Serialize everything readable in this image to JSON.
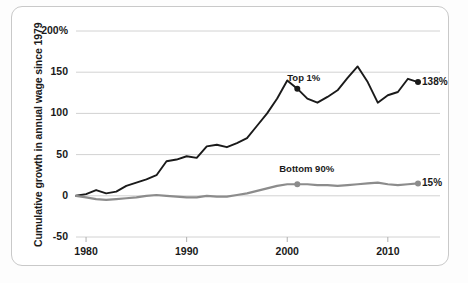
{
  "chart_data": {
    "type": "line",
    "title": "",
    "subtitle": "",
    "xlabel": "",
    "ylabel": "Cumulative growth in annual wage since 1979",
    "xlim": [
      1979,
      2013
    ],
    "ylim": [
      -50,
      200
    ],
    "grid": true,
    "legend": "inline-annotations",
    "yticks": [
      {
        "value": 200,
        "label": "200%"
      },
      {
        "value": 150,
        "label": "150"
      },
      {
        "value": 100,
        "label": "100"
      },
      {
        "value": 50,
        "label": "50"
      },
      {
        "value": 0,
        "label": "0"
      },
      {
        "value": -50,
        "label": "-50"
      }
    ],
    "xticks": [
      {
        "value": 1980,
        "label": "1980"
      },
      {
        "value": 1990,
        "label": "1990"
      },
      {
        "value": 2000,
        "label": "2000"
      },
      {
        "value": 2010,
        "label": "2010"
      }
    ],
    "series": [
      {
        "name": "Top 1%",
        "color": "#1a1a1a",
        "inline_label": "Top 1%",
        "end_label": "138%",
        "end_value": 138,
        "marker_year": 2001,
        "marker_value": 130,
        "x": [
          1979,
          1980,
          1981,
          1982,
          1983,
          1984,
          1985,
          1986,
          1987,
          1988,
          1989,
          1990,
          1991,
          1992,
          1993,
          1994,
          1995,
          1996,
          1997,
          1998,
          1999,
          2000,
          2001,
          2002,
          2003,
          2004,
          2005,
          2006,
          2007,
          2008,
          2009,
          2010,
          2011,
          2012,
          2013
        ],
        "values": [
          0,
          2,
          7,
          3,
          5,
          12,
          16,
          20,
          25,
          42,
          44,
          48,
          46,
          60,
          62,
          59,
          64,
          70,
          85,
          100,
          118,
          140,
          130,
          118,
          113,
          120,
          128,
          143,
          157,
          138,
          113,
          122,
          126,
          142,
          138
        ]
      },
      {
        "name": "Bottom 90%",
        "color": "#8c8c8c",
        "inline_label": "Bottom 90%",
        "end_label": "15%",
        "end_value": 15,
        "marker_year": 2001,
        "marker_value": 14,
        "x": [
          1979,
          1980,
          1981,
          1982,
          1983,
          1984,
          1985,
          1986,
          1987,
          1988,
          1989,
          1990,
          1991,
          1992,
          1993,
          1994,
          1995,
          1996,
          1997,
          1998,
          1999,
          2000,
          2001,
          2002,
          2003,
          2004,
          2005,
          2006,
          2007,
          2008,
          2009,
          2010,
          2011,
          2012,
          2013
        ],
        "values": [
          0,
          -2,
          -4,
          -5,
          -4,
          -3,
          -2,
          0,
          1,
          0,
          -1,
          -2,
          -2,
          0,
          -1,
          -1,
          1,
          3,
          6,
          9,
          12,
          14,
          14,
          14,
          13,
          13,
          12,
          13,
          14,
          15,
          16,
          14,
          13,
          14,
          15
        ]
      }
    ],
    "annotations": [
      {
        "text": "Top 1%",
        "year": 2000,
        "value": 143
      },
      {
        "text": "Bottom 90%",
        "year": 2000,
        "value": 32
      },
      {
        "text": "138%",
        "year": 2013.4,
        "value": 138
      },
      {
        "text": "15%",
        "year": 2013.4,
        "value": 15
      }
    ]
  }
}
